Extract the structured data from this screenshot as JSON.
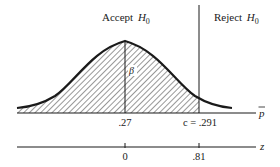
{
  "diagram": {
    "type": "hypothesis-test-normal-curve",
    "region_labels": {
      "accept": "Accept",
      "reject": "Reject",
      "hypothesis": "H",
      "hypothesis_sub": "0"
    },
    "shaded_area_label": "β",
    "upper_axis": {
      "variable": "p",
      "variable_bar": true,
      "ticks": [
        {
          "value": 0.27,
          "label": ".27"
        },
        {
          "value": 0.291,
          "label": "c = .291"
        }
      ]
    },
    "lower_axis": {
      "variable": "z",
      "ticks": [
        {
          "value": 0,
          "label": "0"
        },
        {
          "value": 0.81,
          "label": ".81"
        }
      ]
    },
    "colors": {
      "ink": "#1a1a1a",
      "background": "#ffffff"
    }
  }
}
